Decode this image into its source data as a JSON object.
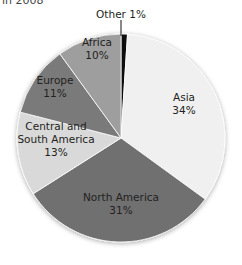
{
  "title_fragment": "in 2008",
  "chart_data": {
    "type": "pie",
    "title": "in 2008",
    "start_angle": "12 o'clock, clockwise",
    "slices": [
      {
        "label": "Other",
        "value": 1,
        "display": "Other 1%",
        "color": "#111111"
      },
      {
        "label": "Asia",
        "value": 34,
        "display": "34%",
        "color": "#f0f0f0"
      },
      {
        "label": "North America",
        "value": 31,
        "display": "31%",
        "color": "#707070"
      },
      {
        "label": "Central and South America",
        "value": 13,
        "display": "13%",
        "color": "#d9d9d9"
      },
      {
        "label": "Europe",
        "value": 11,
        "display": "11%",
        "color": "#7a7a7a"
      },
      {
        "label": "Africa",
        "value": 10,
        "display": "10%",
        "color": "#9e9e9e"
      }
    ]
  },
  "labels": {
    "other": "Other 1%",
    "asia_name": "Asia",
    "asia_pct": "34%",
    "north_america_name": "North America",
    "north_america_pct": "31%",
    "csa_line1": "Central and",
    "csa_line2": "South America",
    "csa_pct": "13%",
    "europe_name": "Europe",
    "europe_pct": "11%",
    "africa_name": "Africa",
    "africa_pct": "10%"
  }
}
